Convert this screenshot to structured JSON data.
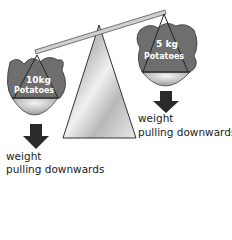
{
  "diagram": {
    "left_sack": {
      "line1": "10kg",
      "line2": "Potatoes"
    },
    "right_sack": {
      "line1": "5 kg",
      "line2": "Potatoes"
    },
    "left_label": {
      "line1": "weight",
      "line2": "pulling downwards"
    },
    "right_label": {
      "line1": "weight",
      "line2": "pulling downwards"
    },
    "colors": {
      "sack": "#6e6e6e",
      "arrow": "#2a2a2a",
      "beam": "#c8c8c8",
      "fulcrum": "#d8d8d8"
    }
  }
}
